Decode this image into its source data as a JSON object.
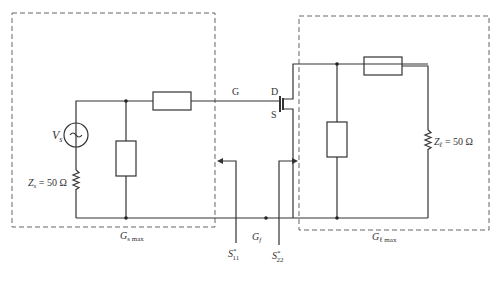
{
  "diagram": {
    "type": "circuit",
    "source": {
      "voltage_label_main": "V",
      "voltage_label_sub": "s",
      "impedance_label_main": "Z",
      "impedance_label_sub": "s",
      "impedance_value": " = 50 Ω"
    },
    "load": {
      "impedance_label_main": "Z",
      "impedance_label_sub": "ℓ",
      "impedance_value": " = 50 Ω"
    },
    "transistor": {
      "gate": "G",
      "drain": "D",
      "source": "S"
    },
    "sections": {
      "input_gain_main": "G",
      "input_gain_sub": "s max",
      "device_gain_main": "G",
      "device_gain_sub": "f",
      "output_gain_main": "G",
      "output_gain_sub": "ℓ max"
    },
    "reflections": {
      "input_main": "S",
      "input_sup": "*",
      "input_sub": "11",
      "output_main": "S",
      "output_sup": "*",
      "output_sub": "22"
    }
  }
}
